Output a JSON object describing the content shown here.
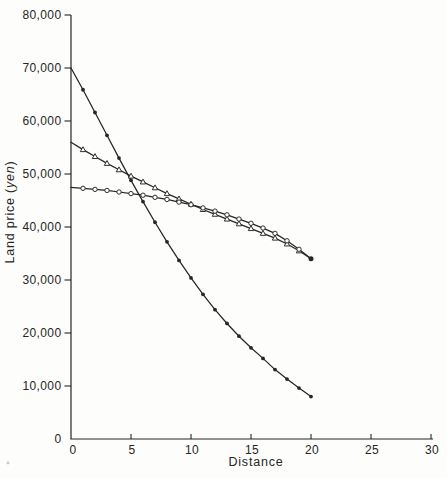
{
  "figure": {
    "background": "#fdfdfb",
    "ink": "#262626",
    "marker_fill": "#ffffff"
  },
  "chart_data": {
    "type": "line",
    "title": "",
    "xlabel": "Distance",
    "ylabel_prefix": "Land price (",
    "ylabel_italic": "yen",
    "ylabel_suffix": ")",
    "xlim": [
      0,
      30
    ],
    "ylim": [
      0,
      80000
    ],
    "grid": false,
    "legend": "none",
    "x_ticks": [
      5,
      10,
      15,
      20,
      25,
      30
    ],
    "x_tick_labels": [
      "5",
      "10",
      "15",
      "20",
      "25",
      "30"
    ],
    "x_origin_label": "0",
    "y_ticks": [
      10000,
      20000,
      30000,
      40000,
      50000,
      60000,
      70000,
      80000
    ],
    "y_tick_labels": [
      "10,000",
      "20,000",
      "30,000",
      "40,000",
      "50,000",
      "60,000",
      "70,000",
      "80,000"
    ],
    "y_origin_label": "0",
    "x": [
      0,
      1,
      2,
      3,
      4,
      5,
      6,
      7,
      8,
      9,
      10,
      11,
      12,
      13,
      14,
      15,
      16,
      17,
      18,
      19,
      20
    ],
    "series": [
      {
        "name": "steep-exponential-decay",
        "marker": "filled-circle",
        "values": [
          70000,
          65900,
          61600,
          57300,
          53000,
          48800,
          44800,
          40900,
          37200,
          33700,
          30400,
          27300,
          24400,
          21800,
          19400,
          17200,
          15200,
          13100,
          11300,
          9600,
          8000
        ]
      },
      {
        "name": "straight-decline",
        "marker": "open-triangle",
        "values": [
          56000,
          54600,
          53300,
          52000,
          50800,
          49600,
          48500,
          47400,
          46300,
          45300,
          44300,
          43300,
          42400,
          41500,
          40600,
          39700,
          38800,
          37900,
          36800,
          35500,
          34000
        ]
      },
      {
        "name": "shallow-concave-decline",
        "marker": "open-circle",
        "values": [
          47500,
          47300,
          47100,
          46900,
          46600,
          46300,
          46000,
          45600,
          45200,
          44700,
          44200,
          43600,
          43000,
          42300,
          41500,
          40700,
          39800,
          38800,
          37400,
          35800,
          34000
        ]
      }
    ],
    "endpoint_dot": {
      "x": 20,
      "y": 34000
    }
  }
}
